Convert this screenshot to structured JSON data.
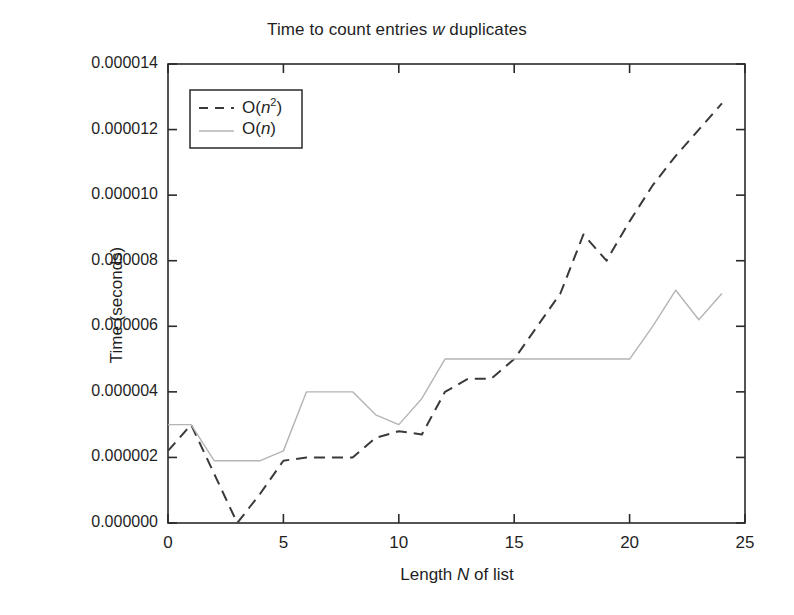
{
  "chart_data": {
    "type": "line",
    "title": "Time to count entries w duplicates",
    "title_parts": {
      "before": "Time to count entries ",
      "italic": "w",
      "after": " duplicates"
    },
    "xlabel": "Length N of list",
    "xlabel_parts": {
      "before": "Length ",
      "italic": "N",
      "after": " of list"
    },
    "ylabel": "Time (seconds)",
    "xlim": [
      0,
      25
    ],
    "ylim": [
      0,
      1.4e-05
    ],
    "grid": false,
    "legend_position": "upper left",
    "xticks": [
      0,
      5,
      10,
      15,
      20,
      25
    ],
    "xtick_labels": [
      "0",
      "5",
      "10",
      "15",
      "20",
      "25"
    ],
    "yticks": [
      0.0,
      2e-06,
      4e-06,
      6e-06,
      8e-06,
      1e-05,
      1.2e-05,
      1.4e-05
    ],
    "ytick_labels": [
      "0.000000",
      "0.000002",
      "0.000004",
      "0.000006",
      "0.000008",
      "0.000010",
      "0.000012",
      "0.000014"
    ],
    "x": [
      0,
      1,
      2,
      3,
      4,
      5,
      6,
      7,
      8,
      9,
      10,
      11,
      12,
      13,
      14,
      15,
      16,
      17,
      18,
      19,
      20,
      21,
      22,
      23,
      24
    ],
    "series": [
      {
        "name": "O(n^2)",
        "label_parts": {
          "before": "O(",
          "italic": "n",
          "sup": "2",
          "after": ")"
        },
        "style": "dashed",
        "color": "#3a3a3a",
        "values": [
          2.2e-06,
          3e-06,
          1.5e-06,
          0.0,
          9e-07,
          1.9e-06,
          2e-06,
          2e-06,
          2e-06,
          2.6e-06,
          2.8e-06,
          2.7e-06,
          4e-06,
          4.4e-06,
          4.4e-06,
          5e-06,
          6e-06,
          7e-06,
          8.8e-06,
          8e-06,
          9.2e-06,
          1.03e-05,
          1.12e-05,
          1.2e-05,
          1.28e-05
        ]
      },
      {
        "name": "O(n)",
        "label_parts": {
          "before": "O(",
          "italic": "n",
          "sup": "",
          "after": ")"
        },
        "style": "solid",
        "color": "#b4b4b4",
        "values": [
          3e-06,
          3e-06,
          1.9e-06,
          1.9e-06,
          1.9e-06,
          2.2e-06,
          4e-06,
          4e-06,
          4e-06,
          3.3e-06,
          3e-06,
          3.8e-06,
          5e-06,
          5e-06,
          5e-06,
          5e-06,
          5e-06,
          5e-06,
          5e-06,
          5e-06,
          5e-06,
          6e-06,
          7.1e-06,
          6.2e-06,
          7e-06
        ]
      }
    ],
    "legend_entries": [
      "O(n2)",
      "O(n)"
    ]
  },
  "axes": {
    "frame_color": "#2a2a2a",
    "background": "#ffffff"
  }
}
